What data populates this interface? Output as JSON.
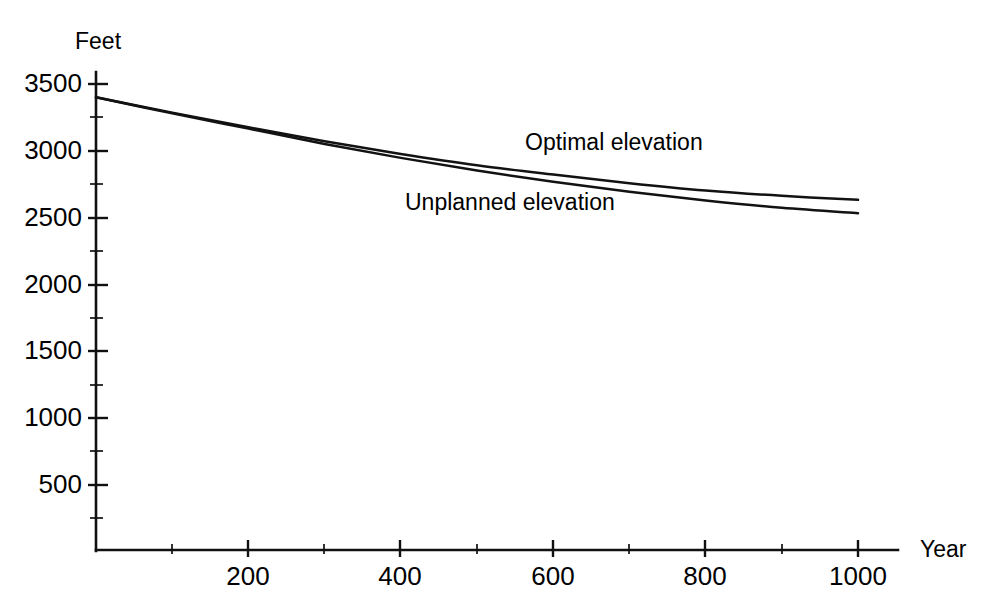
{
  "chart_data": {
    "type": "line",
    "title": "",
    "xlabel": "Year",
    "ylabel": "Feet",
    "xlim": [
      0,
      1050
    ],
    "ylim": [
      0,
      3750
    ],
    "grid": false,
    "legend_position": "inline-annotation",
    "x_ticks": [
      200,
      400,
      600,
      800,
      1000
    ],
    "x_tick_labels": [
      "200",
      "400",
      "600",
      "800",
      "1000"
    ],
    "x_minor_ticks": [
      100,
      300,
      500,
      700,
      900
    ],
    "y_ticks": [
      500,
      1000,
      1500,
      2000,
      2500,
      3000,
      3500
    ],
    "y_tick_labels": [
      "500",
      "1000",
      "1500",
      "2000",
      "2500",
      "3000",
      "3500"
    ],
    "y_minor_ticks": [
      250,
      750,
      1250,
      1750,
      2250,
      2750,
      3250
    ],
    "x": [
      0,
      100,
      200,
      300,
      400,
      500,
      600,
      700,
      800,
      900,
      1000
    ],
    "series": [
      {
        "name": "Optimal elevation",
        "values": [
          3400,
          3285,
          3175,
          3070,
          2975,
          2890,
          2820,
          2755,
          2700,
          2660,
          2630
        ]
      },
      {
        "name": "Unplanned elevation",
        "values": [
          3400,
          3280,
          3165,
          3050,
          2945,
          2850,
          2765,
          2690,
          2625,
          2570,
          2530
        ]
      }
    ],
    "annotations": [
      {
        "text": "Optimal elevation",
        "x_px": 525,
        "y_px": 131
      },
      {
        "text": "Unplanned elevation",
        "x_px": 405,
        "y_px": 191
      }
    ]
  },
  "axis": {
    "y_title": "Feet",
    "x_title": "Year"
  },
  "y_labels": {
    "t3500": "3500",
    "t3000": "3000",
    "t2500": "2500",
    "t2000": "2000",
    "t1500": "1500",
    "t1000": "1000",
    "t500": "500"
  },
  "x_labels": {
    "t200": "200",
    "t400": "400",
    "t600": "600",
    "t800": "800",
    "t1000": "1000"
  },
  "series_labels": {
    "optimal": "Optimal elevation",
    "unplanned": "Unplanned elevation"
  },
  "colors": {
    "ink": "#111111",
    "background": "#ffffff"
  }
}
